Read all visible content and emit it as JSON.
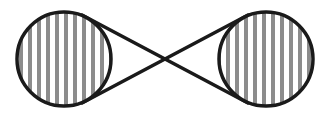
{
  "diagram": {
    "type": "figure-eight-pulley",
    "colors": {
      "stroke": "#1a1a1a",
      "stripe": "#8c8c8c",
      "background": "#ffffff"
    },
    "left_circle": {
      "cx": 64,
      "cy": 59,
      "r": 47
    },
    "right_circle": {
      "cx": 266,
      "cy": 59,
      "r": 47
    },
    "crossing_point": {
      "x": 164,
      "y": 60
    },
    "stripe_pitch": 9,
    "stripe_width": 4
  }
}
